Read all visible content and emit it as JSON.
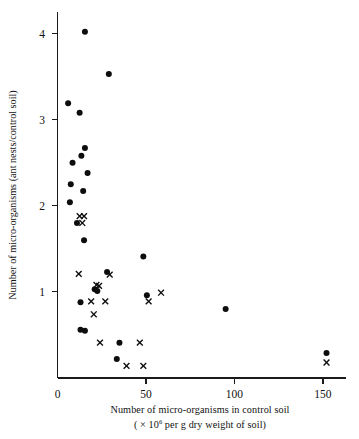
{
  "figure": {
    "background": "#ffffff",
    "ink_color": "#0d0d0d"
  },
  "chart_data": {
    "type": "scatter",
    "title": "",
    "subtitle": "",
    "xlabel": "Number of  micro-organisms in control soil",
    "xlabel_line2_prefix": "( × 10",
    "xlabel_line2_sup": "6",
    "xlabel_line2_suffix": " per g dry weight of soil)",
    "ylabel": "Number of micro-organisms (ant nests/control soil)",
    "xlim": [
      0,
      163
    ],
    "ylim": [
      0,
      4.25
    ],
    "xticks": [
      0,
      50,
      100,
      150
    ],
    "xtick_labels": [
      "0",
      "50",
      "100",
      "150"
    ],
    "yticks": [
      1,
      2,
      3,
      4
    ],
    "ytick_labels": [
      "1",
      "2",
      "3",
      "4"
    ],
    "grid": false,
    "legend": "none",
    "series": [
      {
        "name": "filled-circle",
        "marker": "circle",
        "points": [
          [
            15.5,
            4.02
          ],
          [
            29.0,
            3.53
          ],
          [
            6.0,
            3.19
          ],
          [
            12.5,
            3.08
          ],
          [
            15.5,
            2.67
          ],
          [
            13.5,
            2.58
          ],
          [
            8.5,
            2.5
          ],
          [
            17.0,
            2.38
          ],
          [
            7.5,
            2.25
          ],
          [
            14.5,
            2.17
          ],
          [
            7.0,
            2.04
          ],
          [
            11.0,
            1.8
          ],
          [
            15.0,
            1.6
          ],
          [
            48.5,
            1.41
          ],
          [
            28.0,
            1.23
          ],
          [
            21.0,
            1.03
          ],
          [
            22.5,
            1.01
          ],
          [
            50.5,
            0.96
          ],
          [
            13.0,
            0.88
          ],
          [
            95.0,
            0.8
          ],
          [
            13.0,
            0.56
          ],
          [
            15.5,
            0.55
          ],
          [
            35.0,
            0.41
          ],
          [
            33.5,
            0.22
          ],
          [
            152.0,
            0.29
          ]
        ]
      },
      {
        "name": "cross",
        "marker": "x",
        "points": [
          [
            12.5,
            1.88
          ],
          [
            15.0,
            1.88
          ],
          [
            14.0,
            1.8
          ],
          [
            12.0,
            1.21
          ],
          [
            29.5,
            1.2
          ],
          [
            22.0,
            1.08
          ],
          [
            23.5,
            1.07
          ],
          [
            58.5,
            0.99
          ],
          [
            19.0,
            0.89
          ],
          [
            27.0,
            0.89
          ],
          [
            51.5,
            0.89
          ],
          [
            20.5,
            0.74
          ],
          [
            24.0,
            0.41
          ],
          [
            46.5,
            0.41
          ],
          [
            39.0,
            0.14
          ],
          [
            48.5,
            0.14
          ],
          [
            152.0,
            0.18
          ]
        ]
      }
    ]
  }
}
